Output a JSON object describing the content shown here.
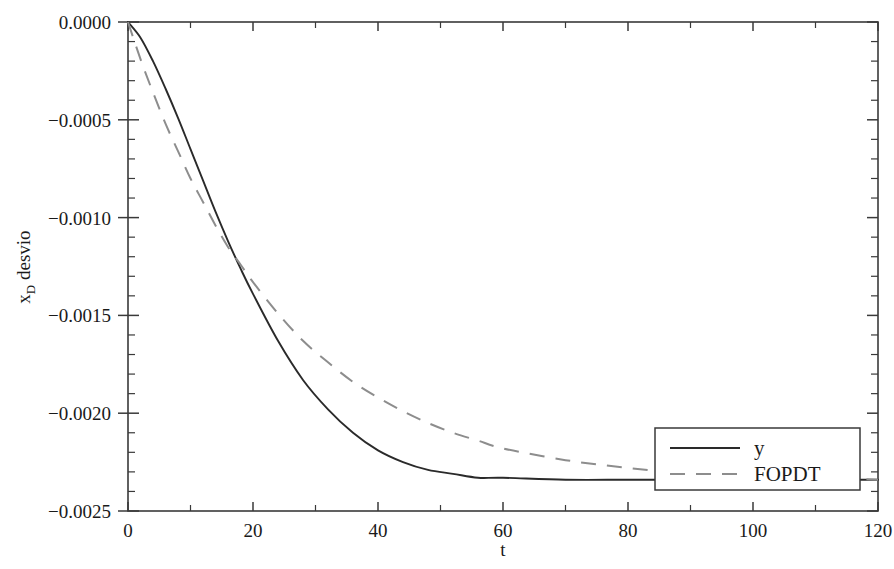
{
  "chart_data": {
    "type": "line",
    "title": "",
    "xlabel": "t",
    "ylabel": "x_D desvio",
    "ylabel_base": "x",
    "ylabel_sub": "D",
    "ylabel_rest": " desvio",
    "xlim": [
      0,
      120
    ],
    "ylim": [
      -0.0025,
      0.0
    ],
    "grid": false,
    "legend_position": "lower right",
    "x_ticks": [
      0,
      20,
      40,
      60,
      80,
      100,
      120
    ],
    "x_tick_labels": [
      "0",
      "20",
      "40",
      "60",
      "80",
      "100",
      "120"
    ],
    "x_minor_step": 10,
    "y_ticks": [
      0.0,
      -0.0005,
      -0.001,
      -0.0015,
      -0.002,
      -0.0025
    ],
    "y_tick_labels": [
      "0.0000",
      "−0.0005",
      "−0.0010",
      "−0.0015",
      "−0.0020",
      "−0.0025"
    ],
    "y_minor_step": 0.0001,
    "series": [
      {
        "name": "y",
        "style": "solid",
        "color": "#2a2a2a",
        "x": [
          0,
          2,
          4,
          6,
          8,
          10,
          12,
          14,
          16,
          18,
          20,
          24,
          28,
          32,
          36,
          40,
          44,
          48,
          52,
          56,
          60,
          70,
          80,
          90,
          100,
          110,
          120
        ],
        "y": [
          0.0,
          -8e-05,
          -0.0002,
          -0.00034,
          -0.00049,
          -0.00065,
          -0.00081,
          -0.00097,
          -0.00112,
          -0.00126,
          -0.00139,
          -0.00163,
          -0.00183,
          -0.00198,
          -0.0021,
          -0.00219,
          -0.00225,
          -0.00229,
          -0.00231,
          -0.00233,
          -0.00233,
          -0.00234,
          -0.00234,
          -0.00234,
          -0.00234,
          -0.00234,
          -0.00234
        ]
      },
      {
        "name": "FOPDT",
        "style": "dashed",
        "color": "#8d8d8d",
        "x": [
          0,
          2,
          4,
          6,
          8,
          10,
          12,
          14,
          16,
          18,
          20,
          24,
          28,
          32,
          36,
          40,
          44,
          48,
          52,
          56,
          60,
          70,
          80,
          90,
          100,
          110,
          120
        ],
        "y": [
          0.0,
          -0.00019,
          -0.00036,
          -0.00052,
          -0.00066,
          -0.0008,
          -0.00092,
          -0.00104,
          -0.00115,
          -0.00124,
          -0.00133,
          -0.00149,
          -0.00163,
          -0.00174,
          -0.00184,
          -0.00192,
          -0.00199,
          -0.00205,
          -0.0021,
          -0.00214,
          -0.00218,
          -0.00224,
          -0.00228,
          -0.00231,
          -0.00232,
          -0.00233,
          -0.00234
        ]
      }
    ],
    "legend_entries": [
      {
        "label": "y",
        "style": "solid"
      },
      {
        "label": "FOPDT",
        "style": "dashed"
      }
    ]
  }
}
